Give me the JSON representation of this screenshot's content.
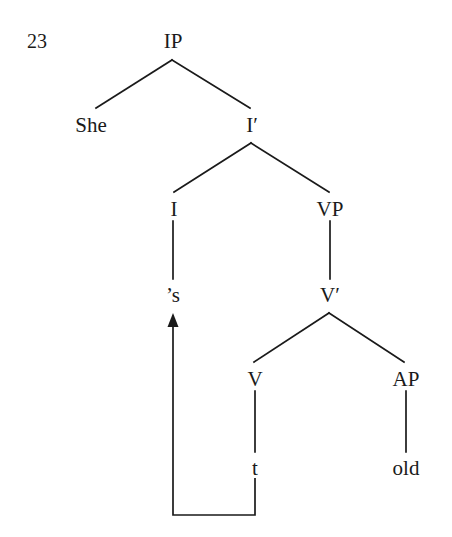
{
  "figure": {
    "kind": "syntax-tree",
    "example_number": "23",
    "sentence": "She 's old",
    "ink_color": "#1a1a1a",
    "background_color": "#ffffff"
  },
  "nodes": [
    {
      "id": "ip",
      "label": "IP",
      "x": 173,
      "y": 41,
      "type": "phrase"
    },
    {
      "id": "she",
      "label": "She",
      "x": 91,
      "y": 125,
      "type": "terminal"
    },
    {
      "id": "ibar",
      "label": "I′",
      "x": 252,
      "y": 125,
      "type": "bar"
    },
    {
      "id": "i",
      "label": "I",
      "x": 174,
      "y": 209,
      "type": "head"
    },
    {
      "id": "vp",
      "label": "VP",
      "x": 330,
      "y": 209,
      "type": "phrase"
    },
    {
      "id": "s",
      "label": "’s",
      "x": 173,
      "y": 295,
      "type": "terminal"
    },
    {
      "id": "vbar",
      "label": "V′",
      "x": 330,
      "y": 295,
      "type": "bar"
    },
    {
      "id": "v",
      "label": "V",
      "x": 255,
      "y": 379,
      "type": "head"
    },
    {
      "id": "ap",
      "label": "AP",
      "x": 406,
      "y": 379,
      "type": "phrase"
    },
    {
      "id": "t",
      "label": "t",
      "x": 255,
      "y": 468,
      "type": "trace"
    },
    {
      "id": "old",
      "label": "old",
      "x": 406,
      "y": 468,
      "type": "terminal"
    }
  ],
  "branches": [
    {
      "from": "ip",
      "to": "she",
      "x1": 172,
      "y1": 60,
      "x2": 96,
      "y2": 108
    },
    {
      "from": "ip",
      "to": "ibar",
      "x1": 172,
      "y1": 60,
      "x2": 250,
      "y2": 108
    },
    {
      "from": "ibar",
      "to": "i",
      "x1": 251,
      "y1": 143,
      "x2": 174,
      "y2": 192
    },
    {
      "from": "ibar",
      "to": "vp",
      "x1": 251,
      "y1": 143,
      "x2": 329,
      "y2": 192
    },
    {
      "from": "i",
      "to": "s",
      "x1": 173,
      "y1": 221,
      "x2": 173,
      "y2": 279
    },
    {
      "from": "vp",
      "to": "vbar",
      "x1": 330,
      "y1": 221,
      "x2": 330,
      "y2": 279
    },
    {
      "from": "vbar",
      "to": "v",
      "x1": 329,
      "y1": 313,
      "x2": 254,
      "y2": 362
    },
    {
      "from": "vbar",
      "to": "ap",
      "x1": 329,
      "y1": 313,
      "x2": 404,
      "y2": 362
    },
    {
      "from": "v",
      "to": "t",
      "x1": 255,
      "y1": 391,
      "x2": 255,
      "y2": 452
    },
    {
      "from": "ap",
      "to": "old",
      "x1": 406,
      "y1": 391,
      "x2": 406,
      "y2": 452
    }
  ],
  "movement_arrow": {
    "from_node": "t",
    "to_node": "s",
    "description": "trace-to-head movement arrow",
    "path": "M 255 478 L 255 515 L 173 515 L 173 325",
    "arrowhead_tip": {
      "x": 173,
      "y": 313
    }
  }
}
